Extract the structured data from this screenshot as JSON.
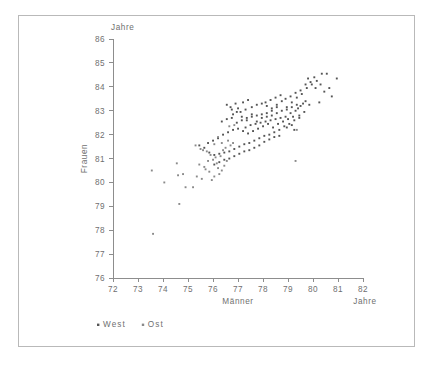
{
  "figure": {
    "y_unit_label": "Jahre",
    "x_unit_label": "Jahre",
    "xlabel": "Männer",
    "ylabel": "Frauen"
  },
  "legend": {
    "items": [
      {
        "label": "West",
        "color": "#555555",
        "marker": "dot"
      },
      {
        "label": "Ost",
        "color": "#8a8a8a",
        "marker": "dot"
      }
    ]
  },
  "source": {
    "line1": "Datenbasis: Bevölkerungsfortschreibung des Bundes",
    "line2": "und der Länder, eigenen Berechnungen, Kreise und kreisfreie Städte",
    "copyright": "© BBSR Bonn 2011"
  },
  "chart_data": {
    "type": "scatter",
    "title": "",
    "xlabel": "Männer",
    "ylabel": "Frauen",
    "xunit": "Jahre",
    "yunit": "Jahre",
    "xlim": [
      72,
      82
    ],
    "ylim": [
      76,
      86
    ],
    "xticks": [
      72,
      73,
      74,
      75,
      76,
      77,
      78,
      79,
      80,
      81,
      82
    ],
    "yticks": [
      76,
      77,
      78,
      79,
      80,
      81,
      82,
      83,
      84,
      85,
      86
    ],
    "grid": false,
    "legend_position": "below-axes-left",
    "series": [
      {
        "name": "West",
        "color": "#555555",
        "points": [
          [
            76.55,
            83.25
          ],
          [
            76.75,
            83.05
          ],
          [
            76.95,
            82.95
          ],
          [
            77.15,
            82.75
          ],
          [
            77.35,
            82.6
          ],
          [
            77.55,
            82.85
          ],
          [
            77.75,
            82.55
          ],
          [
            77.95,
            82.7
          ],
          [
            78.15,
            82.9
          ],
          [
            78.35,
            83.1
          ],
          [
            78.55,
            83.25
          ],
          [
            78.75,
            83.4
          ],
          [
            78.95,
            83.15
          ],
          [
            79.15,
            83.35
          ],
          [
            79.35,
            83.55
          ],
          [
            79.55,
            83.7
          ],
          [
            79.75,
            83.95
          ],
          [
            79.95,
            84.1
          ],
          [
            80.15,
            84.25
          ],
          [
            80.35,
            84.55
          ],
          [
            80.55,
            84.55
          ],
          [
            80.75,
            83.6
          ],
          [
            80.95,
            84.35
          ],
          [
            80.25,
            83.35
          ],
          [
            79.85,
            83.25
          ],
          [
            79.65,
            82.95
          ],
          [
            79.45,
            82.8
          ],
          [
            79.25,
            82.6
          ],
          [
            79.05,
            82.45
          ],
          [
            78.85,
            82.35
          ],
          [
            78.65,
            82.2
          ],
          [
            78.45,
            82.1
          ],
          [
            78.25,
            82.0
          ],
          [
            78.05,
            81.95
          ],
          [
            77.85,
            81.85
          ],
          [
            77.65,
            81.75
          ],
          [
            77.45,
            81.65
          ],
          [
            77.25,
            81.6
          ],
          [
            77.05,
            81.5
          ],
          [
            76.85,
            81.4
          ],
          [
            76.65,
            81.3
          ],
          [
            76.45,
            81.25
          ],
          [
            76.25,
            81.2
          ],
          [
            76.05,
            81.15
          ],
          [
            75.85,
            81.25
          ],
          [
            75.65,
            81.45
          ],
          [
            75.45,
            81.55
          ],
          [
            77.3,
            82.3
          ],
          [
            77.5,
            82.4
          ],
          [
            77.7,
            82.45
          ],
          [
            77.9,
            82.5
          ],
          [
            78.1,
            82.55
          ],
          [
            78.3,
            82.6
          ],
          [
            78.5,
            82.65
          ],
          [
            78.7,
            82.7
          ],
          [
            78.9,
            82.75
          ],
          [
            79.1,
            82.9
          ],
          [
            79.3,
            83.0
          ],
          [
            79.5,
            83.2
          ],
          [
            79.7,
            83.4
          ],
          [
            76.6,
            82.1
          ],
          [
            76.8,
            82.2
          ],
          [
            77.0,
            82.25
          ],
          [
            77.2,
            82.15
          ],
          [
            77.4,
            82.05
          ],
          [
            77.6,
            82.15
          ],
          [
            77.8,
            82.25
          ],
          [
            78.0,
            82.35
          ],
          [
            78.2,
            82.45
          ],
          [
            78.4,
            82.3
          ],
          [
            78.6,
            82.45
          ],
          [
            78.8,
            82.55
          ],
          [
            79.0,
            82.65
          ],
          [
            79.2,
            82.75
          ],
          [
            79.4,
            83.1
          ],
          [
            79.6,
            83.3
          ],
          [
            76.4,
            82.0
          ],
          [
            76.2,
            81.85
          ],
          [
            76.0,
            81.75
          ],
          [
            75.8,
            81.65
          ],
          [
            77.1,
            82.95
          ],
          [
            77.3,
            83.05
          ],
          [
            76.9,
            83.3
          ],
          [
            76.7,
            83.15
          ],
          [
            78.1,
            83.35
          ],
          [
            78.3,
            83.45
          ],
          [
            78.5,
            83.55
          ],
          [
            78.7,
            83.65
          ],
          [
            78.9,
            83.5
          ],
          [
            79.1,
            83.6
          ],
          [
            79.3,
            83.75
          ],
          [
            79.5,
            83.85
          ],
          [
            79.7,
            84.1
          ],
          [
            79.9,
            84.2
          ],
          [
            80.1,
            83.95
          ],
          [
            80.3,
            84.1
          ],
          [
            77.55,
            83.15
          ],
          [
            77.75,
            83.25
          ],
          [
            77.95,
            83.3
          ],
          [
            78.15,
            83.2
          ],
          [
            76.35,
            82.55
          ],
          [
            76.55,
            82.65
          ],
          [
            76.75,
            82.7
          ],
          [
            76.95,
            82.5
          ],
          [
            77.15,
            82.6
          ],
          [
            77.35,
            82.7
          ],
          [
            77.55,
            82.75
          ],
          [
            77.75,
            82.8
          ],
          [
            77.95,
            82.85
          ],
          [
            78.15,
            82.75
          ],
          [
            78.35,
            82.8
          ],
          [
            78.55,
            82.9
          ],
          [
            78.75,
            83.0
          ],
          [
            78.95,
            83.05
          ],
          [
            79.15,
            83.15
          ],
          [
            79.35,
            83.25
          ],
          [
            79.25,
            82.2
          ],
          [
            79.45,
            82.7
          ],
          [
            78.05,
            81.7
          ],
          [
            78.25,
            81.8
          ],
          [
            77.85,
            81.55
          ],
          [
            77.65,
            81.45
          ],
          [
            77.45,
            81.35
          ],
          [
            77.25,
            81.3
          ],
          [
            77.05,
            81.2
          ],
          [
            76.85,
            81.1
          ],
          [
            76.65,
            81.0
          ],
          [
            76.45,
            80.95
          ],
          [
            76.25,
            80.85
          ],
          [
            76.05,
            80.75
          ],
          [
            78.45,
            81.9
          ],
          [
            78.65,
            81.95
          ],
          [
            80.45,
            83.8
          ],
          [
            80.65,
            83.95
          ],
          [
            80.05,
            84.4
          ],
          [
            79.8,
            84.35
          ],
          [
            77.4,
            83.45
          ],
          [
            77.2,
            83.35
          ],
          [
            77.0,
            83.1
          ],
          [
            76.8,
            82.85
          ],
          [
            78.35,
            83.0
          ],
          [
            78.55,
            83.15
          ],
          [
            78.95,
            82.3
          ],
          [
            79.15,
            82.4
          ]
        ]
      },
      {
        "name": "Ost",
        "color": "#8a8a8a",
        "points": [
          [
            73.6,
            77.85
          ],
          [
            73.55,
            80.5
          ],
          [
            74.05,
            80.0
          ],
          [
            74.55,
            80.8
          ],
          [
            74.65,
            79.1
          ],
          [
            74.6,
            80.3
          ],
          [
            74.9,
            79.8
          ],
          [
            75.2,
            79.8
          ],
          [
            75.35,
            80.25
          ],
          [
            75.55,
            80.15
          ],
          [
            75.7,
            80.55
          ],
          [
            75.85,
            80.45
          ],
          [
            76.05,
            80.25
          ],
          [
            76.2,
            80.6
          ],
          [
            76.35,
            80.5
          ],
          [
            75.45,
            80.75
          ],
          [
            75.6,
            81.35
          ],
          [
            75.75,
            81.3
          ],
          [
            75.9,
            81.15
          ],
          [
            76.1,
            81.05
          ],
          [
            76.3,
            81.1
          ],
          [
            75.3,
            81.55
          ],
          [
            75.5,
            81.4
          ],
          [
            76.15,
            80.8
          ],
          [
            76.45,
            80.7
          ],
          [
            76.55,
            80.9
          ],
          [
            76.25,
            80.35
          ],
          [
            75.95,
            80.1
          ],
          [
            74.8,
            80.35
          ],
          [
            79.3,
            80.9
          ],
          [
            79.35,
            82.2
          ],
          [
            76.7,
            81.55
          ],
          [
            76.5,
            81.45
          ],
          [
            76.35,
            81.65
          ],
          [
            76.6,
            81.75
          ],
          [
            76.8,
            81.65
          ],
          [
            75.8,
            80.9
          ],
          [
            75.65,
            80.65
          ],
          [
            76.0,
            80.95
          ],
          [
            76.4,
            81.35
          ],
          [
            76.65,
            82.35
          ],
          [
            76.85,
            82.4
          ],
          [
            76.2,
            81.9
          ],
          [
            76.05,
            81.6
          ]
        ]
      }
    ]
  }
}
